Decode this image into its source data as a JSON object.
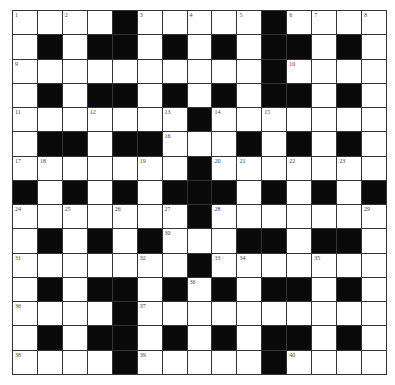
{
  "puzzle": {
    "rows": 15,
    "cols": 15,
    "colors": {
      "block": "#0a0a0a",
      "cell": "#ffffff",
      "line": "#333333",
      "number": "#444444"
    },
    "grid": [
      "WWWWBWWWWWBWWWW",
      "WBWBBWBWBWBBWBW",
      "WWWWWWWWWWBWWWW",
      "WBWBBWBWBWBBWBW",
      "WWWWWWWBWWWWWWW",
      "WBBWBBWWWBWBWBW",
      "WWWWWWWBWWWWWWW",
      "BWBWBWBBBWBWBWB",
      "WWWWWWWBWWWWWWW",
      "WBWBWBWWWBBWBBW",
      "WWWWWWWBWWWWWWW",
      "WBWBBWBWBWBBWBW",
      "WWWWBWWWWWWWWWW",
      "WBWBBWBWBWBBWBW",
      "WWWWBWWWWWBWWWW"
    ],
    "numbers": [
      {
        "r": 0,
        "c": 0,
        "n": "1"
      },
      {
        "r": 0,
        "c": 2,
        "n": "2"
      },
      {
        "r": 0,
        "c": 5,
        "n": "3"
      },
      {
        "r": 0,
        "c": 7,
        "n": "4"
      },
      {
        "r": 0,
        "c": 9,
        "n": "5"
      },
      {
        "r": 0,
        "c": 11,
        "n": "6"
      },
      {
        "r": 0,
        "c": 12,
        "n": "7"
      },
      {
        "r": 0,
        "c": 14,
        "n": "8"
      },
      {
        "r": 2,
        "c": 0,
        "n": "9"
      },
      {
        "r": 2,
        "c": 11,
        "n": "10"
      },
      {
        "r": 4,
        "c": 0,
        "n": "11"
      },
      {
        "r": 4,
        "c": 3,
        "n": "12"
      },
      {
        "r": 4,
        "c": 6,
        "n": "13"
      },
      {
        "r": 4,
        "c": 8,
        "n": "14"
      },
      {
        "r": 4,
        "c": 10,
        "n": "15"
      },
      {
        "r": 5,
        "c": 6,
        "n": "16"
      },
      {
        "r": 6,
        "c": 0,
        "n": "17"
      },
      {
        "r": 6,
        "c": 1,
        "n": "18"
      },
      {
        "r": 6,
        "c": 5,
        "n": "19"
      },
      {
        "r": 6,
        "c": 8,
        "n": "20"
      },
      {
        "r": 6,
        "c": 9,
        "n": "21"
      },
      {
        "r": 6,
        "c": 11,
        "n": "22"
      },
      {
        "r": 6,
        "c": 13,
        "n": "23"
      },
      {
        "r": 8,
        "c": 0,
        "n": "24"
      },
      {
        "r": 8,
        "c": 2,
        "n": "25"
      },
      {
        "r": 8,
        "c": 4,
        "n": "26"
      },
      {
        "r": 8,
        "c": 6,
        "n": "27"
      },
      {
        "r": 8,
        "c": 8,
        "n": "28"
      },
      {
        "r": 8,
        "c": 14,
        "n": "29"
      },
      {
        "r": 9,
        "c": 6,
        "n": "30"
      },
      {
        "r": 10,
        "c": 0,
        "n": "31"
      },
      {
        "r": 10,
        "c": 5,
        "n": "32"
      },
      {
        "r": 10,
        "c": 8,
        "n": "33"
      },
      {
        "r": 10,
        "c": 9,
        "n": "34"
      },
      {
        "r": 10,
        "c": 12,
        "n": "35"
      },
      {
        "r": 11,
        "c": 7,
        "n": "36"
      },
      {
        "r": 12,
        "c": 0,
        "n": "36"
      },
      {
        "r": 12,
        "c": 5,
        "n": "37"
      },
      {
        "r": 14,
        "c": 0,
        "n": "38"
      },
      {
        "r": 14,
        "c": 5,
        "n": "39"
      },
      {
        "r": 14,
        "c": 11,
        "n": "40"
      }
    ]
  }
}
